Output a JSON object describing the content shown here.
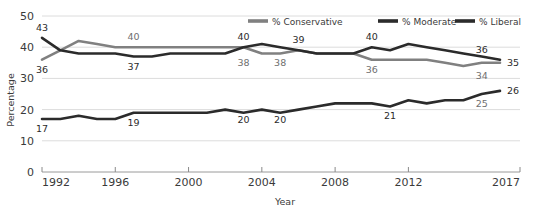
{
  "chart_data": {
    "type": "line",
    "title": "",
    "xlabel": "Year",
    "ylabel": "Percentage",
    "ylim": [
      0,
      50
    ],
    "yticks": [
      0,
      10,
      20,
      30,
      40,
      50
    ],
    "xlim": [
      1992,
      2017
    ],
    "xticks": [
      1992,
      1996,
      2000,
      2004,
      2008,
      2012,
      2017
    ],
    "grid": true,
    "legend_position": "top-right",
    "x": [
      1992,
      1993,
      1994,
      1995,
      1996,
      1997,
      1998,
      1999,
      2000,
      2001,
      2002,
      2003,
      2004,
      2005,
      2006,
      2007,
      2008,
      2009,
      2010,
      2011,
      2012,
      2013,
      2014,
      2015,
      2016,
      2017
    ],
    "series": [
      {
        "name": "% Conservative",
        "color": "#808080",
        "values": [
          36,
          39,
          42,
          41,
          40,
          40,
          40,
          40,
          40,
          40,
          40,
          40,
          38,
          38,
          39,
          38,
          38,
          38,
          36,
          36,
          36,
          36,
          35,
          34,
          35,
          35
        ]
      },
      {
        "name": "% Moderate",
        "color": "#2b2b2b",
        "values": [
          43,
          39,
          38,
          38,
          38,
          37,
          37,
          38,
          38,
          38,
          38,
          40,
          41,
          40,
          39,
          38,
          38,
          38,
          40,
          39,
          41,
          40,
          39,
          38,
          37,
          36
        ]
      },
      {
        "name": "% Liberal",
        "color": "#2b2b2b",
        "values": [
          17,
          17,
          18,
          17,
          17,
          19,
          19,
          19,
          19,
          19,
          20,
          19,
          20,
          19,
          20,
          21,
          22,
          22,
          22,
          21,
          23,
          22,
          23,
          23,
          25,
          26
        ]
      }
    ],
    "point_labels": [
      {
        "text": "43",
        "x": 1992,
        "value": 43,
        "tone": "dark",
        "position": "above"
      },
      {
        "text": "36",
        "x": 1992,
        "value": 36,
        "tone": "dark",
        "position": "below"
      },
      {
        "text": "17",
        "x": 1992,
        "value": 17,
        "tone": "dark",
        "position": "below"
      },
      {
        "text": "40",
        "x": 1997,
        "value": 40,
        "tone": "gray",
        "position": "above"
      },
      {
        "text": "37",
        "x": 1997,
        "value": 37,
        "tone": "dark",
        "position": "below"
      },
      {
        "text": "19",
        "x": 1997,
        "value": 19,
        "tone": "dark",
        "position": "below"
      },
      {
        "text": "40",
        "x": 2003,
        "value": 40,
        "tone": "dark",
        "position": "above"
      },
      {
        "text": "38",
        "x": 2003,
        "value": 38,
        "tone": "gray",
        "position": "below"
      },
      {
        "text": "20",
        "x": 2003,
        "value": 20,
        "tone": "dark",
        "position": "below"
      },
      {
        "text": "39",
        "x": 2006,
        "value": 39,
        "tone": "dark",
        "position": "above"
      },
      {
        "text": "38",
        "x": 2005,
        "value": 38,
        "tone": "gray",
        "position": "below"
      },
      {
        "text": "20",
        "x": 2005,
        "value": 20,
        "tone": "dark",
        "position": "below"
      },
      {
        "text": "40",
        "x": 2010,
        "value": 40,
        "tone": "dark",
        "position": "above"
      },
      {
        "text": "36",
        "x": 2010,
        "value": 36,
        "tone": "gray",
        "position": "below"
      },
      {
        "text": "21",
        "x": 2011,
        "value": 21,
        "tone": "dark",
        "position": "below"
      },
      {
        "text": "36",
        "x": 2016,
        "value": 36,
        "tone": "dark",
        "position": "above"
      },
      {
        "text": "34",
        "x": 2016,
        "value": 34,
        "tone": "gray",
        "position": "below"
      },
      {
        "text": "25",
        "x": 2016,
        "value": 25,
        "tone": "gray",
        "position": "below"
      },
      {
        "text": "35",
        "x": 2017,
        "value": 35,
        "tone": "dark",
        "position": "right"
      },
      {
        "text": "26",
        "x": 2017,
        "value": 26,
        "tone": "dark",
        "position": "right"
      }
    ]
  },
  "legend": {
    "items": [
      {
        "label": "% Conservative",
        "color": "#808080"
      },
      {
        "label": "% Moderate",
        "color": "#2b2b2b"
      },
      {
        "label": "% Liberal",
        "color": "#2b2b2b"
      }
    ]
  },
  "axes": {
    "y_title": "Percentage",
    "x_title": "Year",
    "y_tick_labels": [
      "0",
      "10",
      "20",
      "30",
      "40",
      "50"
    ],
    "x_tick_labels": [
      "1992",
      "1996",
      "2000",
      "2004",
      "2008",
      "2012",
      "2017"
    ]
  }
}
